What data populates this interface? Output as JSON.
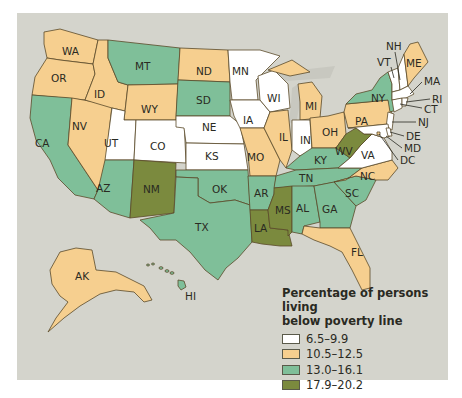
{
  "map": {
    "title": "Percentage of persons living below poverty line",
    "title_line1": "Percentage of persons living",
    "title_line2": "below poverty line",
    "colors": {
      "class1": "#ffffff",
      "class2": "#f6cf8f",
      "class3": "#7fbf99",
      "class4": "#7b8a3e",
      "background": "#d4d4cc",
      "lakes": "#c8c8c0"
    },
    "legend": [
      {
        "label": "6.5–9.9",
        "color": "#ffffff"
      },
      {
        "label": "10.5–12.5",
        "color": "#f6cf8f"
      },
      {
        "label": "13.0–16.1",
        "color": "#7fbf99"
      },
      {
        "label": "17.9–20.2",
        "color": "#7b8a3e"
      }
    ],
    "states": {
      "WA": {
        "label": "WA",
        "class": "10.5–12.5"
      },
      "OR": {
        "label": "OR",
        "class": "10.5–12.5"
      },
      "CA": {
        "label": "CA",
        "class": "13.0–16.1"
      },
      "NV": {
        "label": "NV",
        "class": "10.5–12.5"
      },
      "ID": {
        "label": "ID",
        "class": "10.5–12.5"
      },
      "MT": {
        "label": "MT",
        "class": "13.0–16.1"
      },
      "WY": {
        "label": "WY",
        "class": "10.5–12.5"
      },
      "UT": {
        "label": "UT",
        "class": "6.5–9.9"
      },
      "CO": {
        "label": "CO",
        "class": "6.5–9.9"
      },
      "AZ": {
        "label": "AZ",
        "class": "13.0–16.1"
      },
      "NM": {
        "label": "NM",
        "class": "17.9–20.2"
      },
      "ND": {
        "label": "ND",
        "class": "10.5–12.5"
      },
      "SD": {
        "label": "SD",
        "class": "13.0–16.1"
      },
      "NE": {
        "label": "NE",
        "class": "6.5–9.9"
      },
      "KS": {
        "label": "KS",
        "class": "6.5–9.9"
      },
      "OK": {
        "label": "OK",
        "class": "13.0–16.1"
      },
      "TX": {
        "label": "TX",
        "class": "13.0–16.1"
      },
      "MN": {
        "label": "MN",
        "class": "6.5–9.9"
      },
      "IA": {
        "label": "IA",
        "class": "6.5–9.9"
      },
      "MO": {
        "label": "MO",
        "class": "10.5–12.5"
      },
      "AR": {
        "label": "AR",
        "class": "13.0–16.1"
      },
      "LA": {
        "label": "LA",
        "class": "17.9–20.2"
      },
      "WI": {
        "label": "WI",
        "class": "6.5–9.9"
      },
      "IL": {
        "label": "IL",
        "class": "10.5–12.5"
      },
      "MI": {
        "label": "MI",
        "class": "10.5–12.5"
      },
      "IN": {
        "label": "IN",
        "class": "6.5–9.9"
      },
      "OH": {
        "label": "OH",
        "class": "10.5–12.5"
      },
      "KY": {
        "label": "KY",
        "class": "13.0–16.1"
      },
      "TN": {
        "label": "TN",
        "class": "13.0–16.1"
      },
      "MS": {
        "label": "MS",
        "class": "17.9–20.2"
      },
      "AL": {
        "label": "AL",
        "class": "13.0–16.1"
      },
      "GA": {
        "label": "GA",
        "class": "13.0–16.1"
      },
      "FL": {
        "label": "FL",
        "class": "10.5–12.5"
      },
      "SC": {
        "label": "SC",
        "class": "13.0–16.1"
      },
      "NC": {
        "label": "NC",
        "class": "10.5–12.5"
      },
      "VA": {
        "label": "VA",
        "class": "6.5–9.9"
      },
      "WV": {
        "label": "WV",
        "class": "17.9–20.2"
      },
      "PA": {
        "label": "PA",
        "class": "10.5–12.5"
      },
      "NY": {
        "label": "NY",
        "class": "13.0–16.1"
      },
      "VT": {
        "label": "VT",
        "class": "6.5–9.9"
      },
      "NH": {
        "label": "NH",
        "class": "6.5–9.9"
      },
      "ME": {
        "label": "ME",
        "class": "10.5–12.5"
      },
      "MA": {
        "label": "MA",
        "class": "6.5–9.9"
      },
      "RI": {
        "label": "RI",
        "class": "6.5–9.9"
      },
      "CT": {
        "label": "CT",
        "class": "6.5–9.9"
      },
      "NJ": {
        "label": "NJ",
        "class": "6.5–9.9"
      },
      "DE": {
        "label": "DE",
        "class": "6.5–9.9"
      },
      "MD": {
        "label": "MD",
        "class": "6.5–9.9"
      },
      "DC": {
        "label": "DC",
        "class": "10.5–12.5"
      },
      "AK": {
        "label": "AK",
        "class": "10.5–12.5"
      },
      "HI": {
        "label": "HI",
        "class": "13.0–16.1"
      }
    }
  }
}
